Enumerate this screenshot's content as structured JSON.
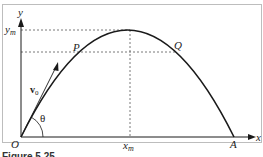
{
  "figure": {
    "caption_partial": "Figure 5.25",
    "labels": {
      "y_axis": "y",
      "x_axis": "x",
      "origin": "O",
      "y_max": "y",
      "y_max_sub": "m",
      "x_max": "x",
      "x_max_sub": "m",
      "point_p": "P",
      "point_q": "Q",
      "landing": "A",
      "velocity": "v",
      "velocity_sub": "0",
      "angle": "θ"
    },
    "colors": {
      "stroke": "#1a1a1a",
      "dashed": "#555555",
      "frame": "#bfbfbf"
    }
  }
}
